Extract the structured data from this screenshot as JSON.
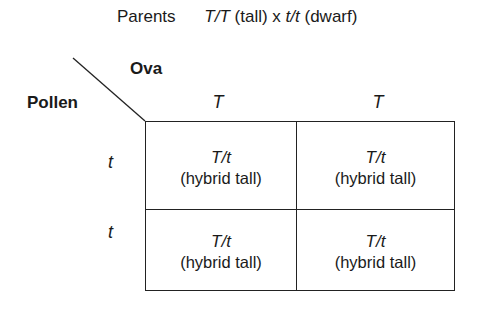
{
  "title": {
    "label": "Parents",
    "parent1_genotype": "T/T",
    "parent1_phenotype": "(tall)",
    "cross": "x",
    "parent2_genotype": "t/t",
    "parent2_phenotype": "(dwarf)"
  },
  "axes": {
    "column_axis_label": "Ova",
    "row_axis_label": "Pollen"
  },
  "columns": [
    "T",
    "T"
  ],
  "rows": [
    "t",
    "t"
  ],
  "cells": [
    [
      {
        "genotype": "T/t",
        "phenotype": "(hybrid tall)"
      },
      {
        "genotype": "T/t",
        "phenotype": "(hybrid tall)"
      }
    ],
    [
      {
        "genotype": "T/t",
        "phenotype": "(hybrid tall)"
      },
      {
        "genotype": "T/t",
        "phenotype": "(hybrid tall)"
      }
    ]
  ]
}
